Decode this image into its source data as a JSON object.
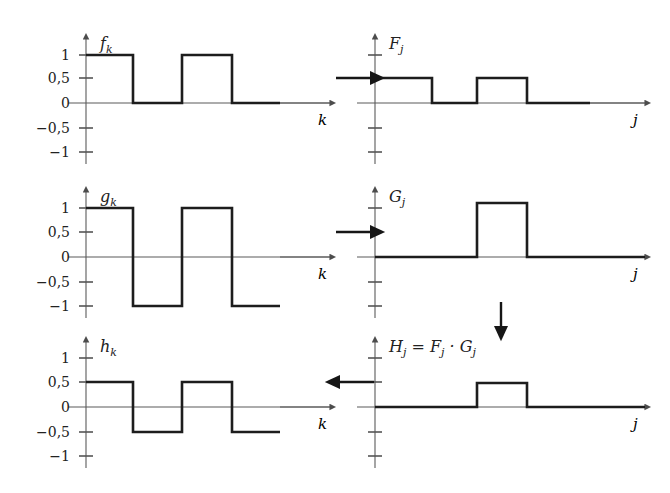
{
  "figure": {
    "background_color": "#ffffff",
    "line_color": "#1d1d1d",
    "axis_color": "#5a5a5a"
  },
  "flow_arrows": [
    {
      "name": "arrow-f-to-F",
      "direction": "right",
      "x1": 336,
      "y1": 78,
      "x2": 372,
      "y2": 78
    },
    {
      "name": "arrow-g-to-G",
      "direction": "right",
      "x1": 336,
      "y1": 232,
      "x2": 372,
      "y2": 232
    },
    {
      "name": "arrow-G-to-H",
      "direction": "down",
      "x1": 501,
      "y1": 302,
      "x2": 501,
      "y2": 328
    },
    {
      "name": "arrow-H-to-h",
      "direction": "left",
      "x1": 374,
      "y1": 382,
      "x2": 338,
      "y2": 382
    }
  ],
  "plots": [
    {
      "id": "plot-fk",
      "title": "f_k",
      "title_html": "f",
      "title_sub": "k",
      "xlabel": "k",
      "ylabel": "",
      "origin": {
        "x": 86,
        "y": 103
      },
      "x_axis_end": 330,
      "y_ticks": [
        {
          "label": "1",
          "value": 1,
          "y": 55
        },
        {
          "label": "0,5",
          "value": 0.5,
          "y": 78
        },
        {
          "label": "0",
          "value": 0,
          "y": 103
        },
        {
          "label": "−0,5",
          "value": -0.5,
          "y": 128
        },
        {
          "label": "−1",
          "value": -1,
          "y": 152
        }
      ],
      "levels_y": {
        "1": 55,
        "0.5": 78,
        "0": 103,
        "-0.5": 128,
        "-1": 152
      },
      "waveform_points": [
        [
          86,
          55
        ],
        [
          133,
          55
        ],
        [
          133,
          103
        ],
        [
          182,
          103
        ],
        [
          182,
          55
        ],
        [
          232,
          55
        ],
        [
          232,
          103
        ],
        [
          280,
          103
        ]
      ],
      "tail": {
        "x1": 280,
        "y": 103,
        "x2": 330
      },
      "signal_values": [
        1,
        1,
        0,
        0,
        1,
        1,
        0,
        0
      ]
    },
    {
      "id": "plot-Fj",
      "title": "F_j",
      "title_html": "F",
      "title_sub": "j",
      "xlabel": "j",
      "ylabel": "",
      "origin": {
        "x": 375,
        "y": 103
      },
      "x_axis_end": 645,
      "y_ticks": [
        {
          "label": "",
          "value": 1,
          "y": 55
        },
        {
          "label": "",
          "value": 0.5,
          "y": 78
        },
        {
          "label": "",
          "value": 0,
          "y": 103
        },
        {
          "label": "",
          "value": -0.5,
          "y": 128
        },
        {
          "label": "",
          "value": -1,
          "y": 152
        }
      ],
      "levels_y": {
        "1": 55,
        "0.5": 78,
        "0": 103,
        "-0.5": 128,
        "-1": 152
      },
      "waveform_points": [
        [
          375,
          78
        ],
        [
          432,
          78
        ],
        [
          432,
          103
        ],
        [
          477,
          103
        ],
        [
          477,
          78
        ],
        [
          527,
          78
        ],
        [
          527,
          103
        ],
        [
          590,
          103
        ]
      ],
      "tail": {
        "x1": 590,
        "y": 103,
        "x2": 645
      },
      "signal_values": [
        0.5,
        0.5,
        0,
        0,
        0.5,
        0.5,
        0,
        0
      ]
    },
    {
      "id": "plot-gk",
      "title": "g_k",
      "title_html": "g",
      "title_sub": "k",
      "xlabel": "k",
      "ylabel": "",
      "origin": {
        "x": 86,
        "y": 257
      },
      "x_axis_end": 330,
      "y_ticks": [
        {
          "label": "1",
          "value": 1,
          "y": 208
        },
        {
          "label": "0,5",
          "value": 0.5,
          "y": 232
        },
        {
          "label": "0",
          "value": 0,
          "y": 257
        },
        {
          "label": "−0,5",
          "value": -0.5,
          "y": 282
        },
        {
          "label": "−1",
          "value": -1,
          "y": 306
        }
      ],
      "levels_y": {
        "1": 208,
        "0.5": 232,
        "0": 257,
        "-0.5": 282,
        "-1": 306
      },
      "waveform_points": [
        [
          86,
          208
        ],
        [
          133,
          208
        ],
        [
          133,
          306
        ],
        [
          182,
          306
        ],
        [
          182,
          208
        ],
        [
          232,
          208
        ],
        [
          232,
          306
        ],
        [
          280,
          306
        ]
      ],
      "tail": {
        "x1": 280,
        "y": 257,
        "x2": 330
      },
      "signal_values": [
        1,
        1,
        -1,
        -1,
        1,
        1,
        -1,
        -1
      ]
    },
    {
      "id": "plot-Gj",
      "title": "G_j",
      "title_html": "G",
      "title_sub": "j",
      "xlabel": "j",
      "ylabel": "",
      "origin": {
        "x": 375,
        "y": 257
      },
      "x_axis_end": 645,
      "y_ticks": [
        {
          "label": "",
          "value": 1,
          "y": 208
        },
        {
          "label": "",
          "value": 0.5,
          "y": 232
        },
        {
          "label": "",
          "value": 0,
          "y": 257
        },
        {
          "label": "",
          "value": -0.5,
          "y": 282
        },
        {
          "label": "",
          "value": -1,
          "y": 306
        }
      ],
      "levels_y": {
        "1": 208,
        "0.5": 232,
        "0": 257,
        "-0.5": 282,
        "-1": 306
      },
      "waveform_points": [
        [
          375,
          257
        ],
        [
          477,
          257
        ],
        [
          477,
          203
        ],
        [
          527,
          203
        ],
        [
          527,
          257
        ],
        [
          645,
          257
        ]
      ],
      "tail": null,
      "signal_values": [
        0,
        0,
        0,
        1,
        1,
        0,
        0,
        0
      ]
    },
    {
      "id": "plot-hk",
      "title": "h_k",
      "title_html": "h",
      "title_sub": "k",
      "xlabel": "k",
      "ylabel": "",
      "origin": {
        "x": 86,
        "y": 407
      },
      "x_axis_end": 330,
      "y_ticks": [
        {
          "label": "1",
          "value": 1,
          "y": 358
        },
        {
          "label": "0,5",
          "value": 0.5,
          "y": 382
        },
        {
          "label": "0",
          "value": 0,
          "y": 407
        },
        {
          "label": "−0,5",
          "value": -0.5,
          "y": 432
        },
        {
          "label": "−1",
          "value": -1,
          "y": 456
        }
      ],
      "levels_y": {
        "1": 358,
        "0.5": 382,
        "0": 407,
        "-0.5": 432,
        "-1": 456
      },
      "waveform_points": [
        [
          86,
          382
        ],
        [
          133,
          382
        ],
        [
          133,
          432
        ],
        [
          182,
          432
        ],
        [
          182,
          382
        ],
        [
          232,
          382
        ],
        [
          232,
          432
        ],
        [
          280,
          432
        ]
      ],
      "tail": {
        "x1": 280,
        "y": 407,
        "x2": 330
      },
      "signal_values": [
        0.5,
        0.5,
        -0.5,
        -0.5,
        0.5,
        0.5,
        -0.5,
        -0.5
      ]
    },
    {
      "id": "plot-Hj",
      "title": "H_j = F_j · G_j",
      "title_html": "H",
      "title_sub": "j",
      "title_rest": " = F",
      "title_sub2": "j",
      "title_rest2": " · G",
      "title_sub3": "j",
      "xlabel": "j",
      "ylabel": "",
      "origin": {
        "x": 375,
        "y": 407
      },
      "x_axis_end": 645,
      "y_ticks": [
        {
          "label": "",
          "value": 1,
          "y": 358
        },
        {
          "label": "",
          "value": 0.5,
          "y": 382
        },
        {
          "label": "",
          "value": 0,
          "y": 407
        },
        {
          "label": "",
          "value": -0.5,
          "y": 432
        },
        {
          "label": "",
          "value": -1,
          "y": 456
        }
      ],
      "levels_y": {
        "1": 358,
        "0.5": 382,
        "0": 407,
        "-0.5": 432,
        "-1": 456
      },
      "waveform_points": [
        [
          375,
          407
        ],
        [
          477,
          407
        ],
        [
          477,
          383
        ],
        [
          527,
          383
        ],
        [
          527,
          407
        ],
        [
          645,
          407
        ]
      ],
      "tail": null,
      "signal_values": [
        0,
        0,
        0,
        0.5,
        0.5,
        0,
        0,
        0
      ]
    }
  ],
  "chart_data": {
    "type": "line",
    "grid": false,
    "legend": null,
    "panels": [
      {
        "name": "f_k",
        "xlabel": "k",
        "ylabel": "f_k",
        "ylim": [
          -1.3,
          1.3
        ],
        "ytick_labels": [
          "1",
          "0,5",
          "0",
          "−0,5",
          "−1"
        ],
        "ytick_values": [
          1,
          0.5,
          0,
          -0.5,
          -1
        ],
        "step_values": [
          1,
          0,
          1,
          0
        ],
        "description": "Square wave alternating between 1 and 0, two high pulses then zero"
      },
      {
        "name": "F_j",
        "xlabel": "j",
        "ylabel": "F_j",
        "ylim": [
          -1.3,
          1.3
        ],
        "ytick_labels": [
          "",
          "",
          "",
          "",
          ""
        ],
        "ytick_values": [
          1,
          0.5,
          0,
          -0.5,
          -1
        ],
        "step_values": [
          0.5,
          0,
          0.5,
          0
        ],
        "description": "Square wave alternating between 0,5 and 0"
      },
      {
        "name": "g_k",
        "xlabel": "k",
        "ylabel": "g_k",
        "ylim": [
          -1.3,
          1.3
        ],
        "ytick_labels": [
          "1",
          "0,5",
          "0",
          "−0,5",
          "−1"
        ],
        "ytick_values": [
          1,
          0.5,
          0,
          -0.5,
          -1
        ],
        "step_values": [
          1,
          -1,
          1,
          -1
        ],
        "description": "Square wave alternating between 1 and −1"
      },
      {
        "name": "G_j",
        "xlabel": "j",
        "ylabel": "G_j",
        "ylim": [
          -1.3,
          1.3
        ],
        "ytick_labels": [
          "",
          "",
          "",
          "",
          ""
        ],
        "ytick_values": [
          1,
          0.5,
          0,
          -0.5,
          -1
        ],
        "step_values": [
          0,
          0,
          1,
          0
        ],
        "description": "Single rectangular pulse of height 1"
      },
      {
        "name": "h_k",
        "xlabel": "k",
        "ylabel": "h_k",
        "ylim": [
          -1.3,
          1.3
        ],
        "ytick_labels": [
          "1",
          "0,5",
          "0",
          "−0,5",
          "−1"
        ],
        "ytick_values": [
          1,
          0.5,
          0,
          -0.5,
          -1
        ],
        "step_values": [
          0.5,
          -0.5,
          0.5,
          -0.5
        ],
        "description": "Square wave alternating between 0,5 and −0,5"
      },
      {
        "name": "H_j = F_j · G_j",
        "xlabel": "j",
        "ylabel": "H_j",
        "ylim": [
          -1.3,
          1.3
        ],
        "ytick_labels": [
          "",
          "",
          "",
          "",
          ""
        ],
        "ytick_values": [
          1,
          0.5,
          0,
          -0.5,
          -1
        ],
        "step_values": [
          0,
          0,
          0.5,
          0
        ],
        "description": "Single rectangular pulse of height 0,5"
      }
    ]
  }
}
